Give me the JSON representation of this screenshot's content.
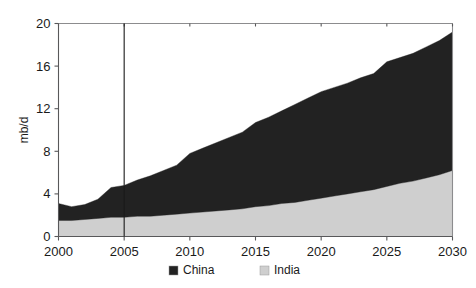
{
  "chart_data": {
    "type": "area",
    "stacked": true,
    "title": "",
    "subtitle": "",
    "xlabel": "",
    "ylabel": "mb/d",
    "xlim": [
      2000,
      2030
    ],
    "ylim": [
      0,
      20
    ],
    "ytick_values": [
      0,
      4,
      8,
      12,
      16,
      20
    ],
    "ytick_labels": [
      "0",
      "4",
      "8",
      "12",
      "16",
      "20"
    ],
    "xtick_values": [
      2000,
      2005,
      2010,
      2015,
      2020,
      2025,
      2030
    ],
    "xtick_labels": [
      "2000",
      "2005",
      "2010",
      "2015",
      "2020",
      "2025",
      "2030"
    ],
    "grid": false,
    "legend_position": "bottom-center",
    "annotations": [
      {
        "name": "history-projection-divider",
        "type": "vline",
        "x": 2005
      }
    ],
    "x": [
      2000,
      2001,
      2002,
      2003,
      2004,
      2005,
      2006,
      2007,
      2008,
      2009,
      2010,
      2011,
      2012,
      2013,
      2014,
      2015,
      2016,
      2017,
      2018,
      2019,
      2020,
      2021,
      2022,
      2023,
      2024,
      2025,
      2026,
      2027,
      2028,
      2029,
      2030
    ],
    "series": [
      {
        "name": "India",
        "color": "#cfcfcf",
        "stack_order": 0,
        "values": [
          1.5,
          1.5,
          1.6,
          1.7,
          1.8,
          1.8,
          1.9,
          1.9,
          2.0,
          2.1,
          2.2,
          2.3,
          2.4,
          2.5,
          2.6,
          2.8,
          2.9,
          3.1,
          3.2,
          3.4,
          3.6,
          3.8,
          4.0,
          4.2,
          4.4,
          4.7,
          5.0,
          5.2,
          5.5,
          5.8,
          6.2
        ]
      },
      {
        "name": "China",
        "color": "#222222",
        "stack_order": 1,
        "values": [
          1.6,
          1.3,
          1.4,
          1.8,
          2.8,
          3.0,
          3.4,
          3.8,
          4.2,
          4.6,
          5.6,
          6.0,
          6.4,
          6.8,
          7.2,
          7.9,
          8.3,
          8.7,
          9.2,
          9.6,
          10.0,
          10.2,
          10.4,
          10.7,
          10.9,
          11.7,
          11.8,
          12.0,
          12.3,
          12.6,
          13.0
        ]
      }
    ],
    "totals": [
      3.1,
      2.8,
      3.0,
      3.5,
      4.6,
      4.8,
      5.3,
      5.7,
      6.2,
      6.7,
      7.8,
      8.3,
      8.8,
      9.3,
      9.8,
      10.7,
      11.2,
      11.8,
      12.4,
      13.0,
      13.6,
      14.0,
      14.4,
      14.9,
      15.3,
      16.4,
      16.8,
      17.2,
      17.8,
      18.4,
      19.2
    ]
  },
  "legend": {
    "items": [
      {
        "label": "China",
        "swatch": "#222222"
      },
      {
        "label": "India",
        "swatch": "#cfcfcf"
      }
    ]
  },
  "axes": {
    "y_axis_title": "mb/d"
  }
}
